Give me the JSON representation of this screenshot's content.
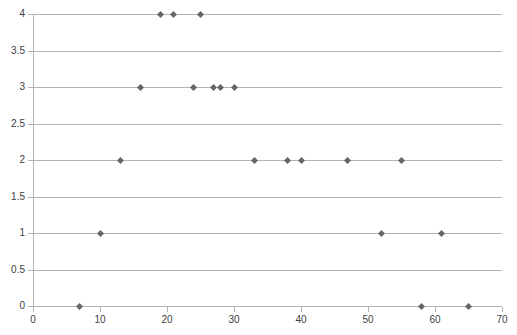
{
  "chart_data": {
    "type": "scatter",
    "title": "",
    "subtitle": "",
    "xlabel": "",
    "ylabel": "",
    "xlim": [
      0,
      70
    ],
    "ylim": [
      0,
      4
    ],
    "grid": true,
    "legend": false,
    "legend_position": "none",
    "marker": {
      "shape": "diamond",
      "color": "#666666",
      "size_px": 5
    },
    "gridline_color": "#b3b3b3",
    "axis_text_color": "#404040",
    "background_color": "#ffffff",
    "x_ticks": [
      0,
      10,
      20,
      30,
      40,
      50,
      60,
      70
    ],
    "x_tick_labels": [
      "0",
      "10",
      "20",
      "30",
      "40",
      "50",
      "60",
      "70"
    ],
    "y_ticks": [
      0,
      0.5,
      1,
      1.5,
      2,
      2.5,
      3,
      3.5,
      4
    ],
    "y_tick_labels": [
      "0",
      "0.5",
      "1",
      "1.5",
      "2",
      "2.5",
      "3",
      "3.5",
      "4"
    ],
    "series": [
      {
        "name": "series-1",
        "points": [
          {
            "x": 7,
            "y": 0
          },
          {
            "x": 58,
            "y": 0
          },
          {
            "x": 65,
            "y": 0
          },
          {
            "x": 10,
            "y": 1
          },
          {
            "x": 52,
            "y": 1
          },
          {
            "x": 61,
            "y": 1
          },
          {
            "x": 13,
            "y": 2
          },
          {
            "x": 33,
            "y": 2
          },
          {
            "x": 38,
            "y": 2
          },
          {
            "x": 40,
            "y": 2
          },
          {
            "x": 47,
            "y": 2
          },
          {
            "x": 55,
            "y": 2
          },
          {
            "x": 16,
            "y": 3
          },
          {
            "x": 24,
            "y": 3
          },
          {
            "x": 27,
            "y": 3
          },
          {
            "x": 28,
            "y": 3
          },
          {
            "x": 30,
            "y": 3
          },
          {
            "x": 19,
            "y": 4
          },
          {
            "x": 21,
            "y": 4
          },
          {
            "x": 25,
            "y": 4
          }
        ]
      }
    ]
  }
}
